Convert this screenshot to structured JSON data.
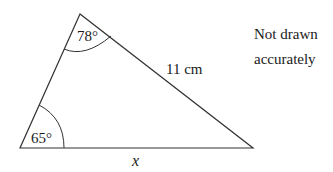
{
  "diagram": {
    "type": "triangle",
    "vertices": {
      "top": {
        "x": 80,
        "y": 14
      },
      "bottom_left": {
        "x": 20,
        "y": 148
      },
      "bottom_right": {
        "x": 253,
        "y": 148
      }
    },
    "angles": {
      "top": "78°",
      "bottom_left": "65°"
    },
    "sides": {
      "right_side_label": "11 cm",
      "base_label": "x"
    },
    "note": {
      "line1": "Not drawn",
      "line2": "accurately"
    },
    "colors": {
      "stroke": "#333333",
      "text": "#1a1a1a",
      "background": "#ffffff"
    }
  }
}
